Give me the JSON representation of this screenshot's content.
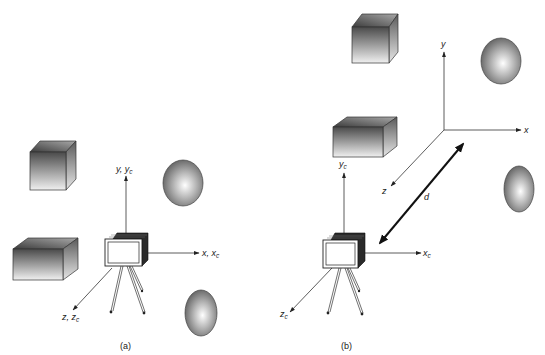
{
  "figure": {
    "panels": [
      {
        "id": "a",
        "caption": "(a)",
        "axes": {
          "y_label": "y, y",
          "y_sub": "c",
          "x_label": "x, x",
          "x_sub": "c",
          "z_label": "z, z",
          "z_sub": "c"
        },
        "objects": [
          "cube",
          "box",
          "sphere",
          "sphere-small",
          "camera-on-tripod"
        ],
        "description": "World frame and camera frame coincide"
      },
      {
        "id": "b",
        "caption": "(b)",
        "world_axes": {
          "y_label": "y",
          "x_label": "x",
          "z_label": "z"
        },
        "camera_axes": {
          "y_label": "y",
          "y_sub": "c",
          "x_label": "x",
          "x_sub": "c",
          "z_label": "z",
          "z_sub": "c"
        },
        "distance_label": "d",
        "objects": [
          "cube",
          "box",
          "sphere",
          "sphere-small",
          "camera-on-tripod"
        ],
        "description": "Camera frame displaced from world frame by distance d"
      }
    ],
    "colors": {
      "background": "#ffffff",
      "line": "#333333",
      "shade_dark": "#3a3a3a",
      "shade_light": "#f2f2f2"
    }
  }
}
